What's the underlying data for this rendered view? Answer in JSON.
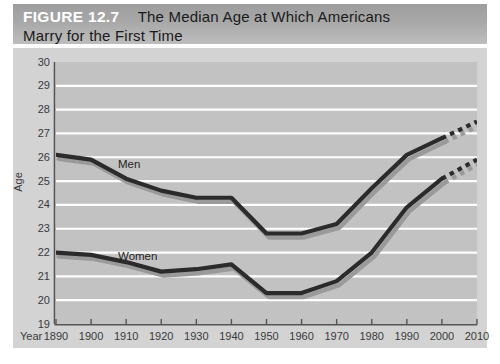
{
  "figure": {
    "number_label": "FIGURE 12.7",
    "title": "The Median Age at Which Americans",
    "title_line2": "Marry for the First Time",
    "footnote": ""
  },
  "axes": {
    "y_title": "Age",
    "x_title": "Year",
    "y_ticks": [
      "30",
      "29",
      "28",
      "27",
      "26",
      "25",
      "24",
      "23",
      "22",
      "21",
      "20",
      "19"
    ],
    "x_ticks": [
      "1890",
      "1900",
      "1910",
      "1920",
      "1930",
      "1940",
      "1950",
      "1960",
      "1970",
      "1980",
      "1990",
      "2000",
      "2010"
    ]
  },
  "colors": {
    "banner_grey": "#a8a8a8",
    "panel_grey": "#d3d3d3",
    "plot_grey": "#c2c2c2",
    "gridline": "#ffffff",
    "series_line": "#2b2b2b",
    "series_shadow": "#9a9a9a",
    "axis": "#555555",
    "tick_text": "#3a3a3a"
  },
  "chart_data": {
    "type": "line",
    "title": "The Median Age at Which Americans Marry for the First Time",
    "xlabel": "Year",
    "ylabel": "Age",
    "ylim": [
      19,
      30
    ],
    "xlim": [
      1890,
      2010
    ],
    "grid": true,
    "legend": "inline-labels",
    "x": [
      1890,
      1900,
      1910,
      1920,
      1930,
      1940,
      1950,
      1960,
      1970,
      1980,
      1990,
      2000,
      2010
    ],
    "series": [
      {
        "name": "Men",
        "values": [
          26.1,
          25.9,
          25.1,
          24.6,
          24.3,
          24.3,
          22.8,
          22.8,
          23.2,
          24.7,
          26.1,
          26.8,
          27.5
        ],
        "projected_from": 2000,
        "style": "solid-with-dotted-projection"
      },
      {
        "name": "Women",
        "values": [
          22.0,
          21.9,
          21.6,
          21.2,
          21.3,
          21.5,
          20.3,
          20.3,
          20.8,
          22.0,
          23.9,
          25.1,
          25.9
        ],
        "projected_from": 2000,
        "style": "solid-with-dotted-projection"
      }
    ],
    "annotations": [
      {
        "text": "Men",
        "x": 1905,
        "y": 25.2
      },
      {
        "text": "Women",
        "x": 1905,
        "y": 21.3
      }
    ]
  }
}
